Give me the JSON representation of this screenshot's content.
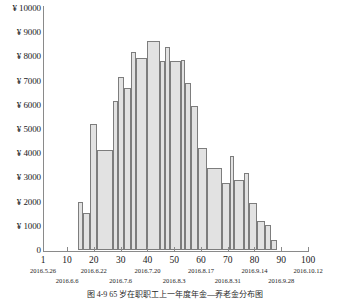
{
  "chart_data": {
    "type": "bar",
    "title": "",
    "subtitle": "",
    "xlabel": "",
    "ylabel": "",
    "xlim": [
      1,
      100
    ],
    "ylim": [
      0,
      10000
    ],
    "grid": false,
    "legend": null,
    "y_ticks": [
      {
        "value": 10000,
        "label": "¥ 10000"
      },
      {
        "value": 9000,
        "label": "¥ 9000"
      },
      {
        "value": 8000,
        "label": "¥ 8000"
      },
      {
        "value": 7000,
        "label": "¥ 7000"
      },
      {
        "value": 6000,
        "label": "¥ 6000"
      },
      {
        "value": 5000,
        "label": "¥ 5000"
      },
      {
        "value": 4000,
        "label": "¥ 4000"
      },
      {
        "value": 3000,
        "label": "¥ 3000"
      },
      {
        "value": 2000,
        "label": "¥ 2000"
      },
      {
        "value": 1000,
        "label": "¥ 1000"
      },
      {
        "value": 0,
        "label": "0"
      }
    ],
    "x_ticks": [
      {
        "value": 1,
        "label": "1",
        "date_upper": "2016.5.26",
        "date_lower": ""
      },
      {
        "value": 10,
        "label": "10",
        "date_upper": "",
        "date_lower": "2016.6.6"
      },
      {
        "value": 20,
        "label": "20",
        "date_upper": "2016.6.22",
        "date_lower": ""
      },
      {
        "value": 30,
        "label": "30",
        "date_upper": "",
        "date_lower": "2016.7.6"
      },
      {
        "value": 40,
        "label": "40",
        "date_upper": "2016.7.20",
        "date_lower": ""
      },
      {
        "value": 50,
        "label": "50",
        "date_upper": "",
        "date_lower": "2016.8.3"
      },
      {
        "value": 60,
        "label": "60",
        "date_upper": "2016.8.17",
        "date_lower": ""
      },
      {
        "value": 70,
        "label": "70",
        "date_upper": "",
        "date_lower": "2016.8.31"
      },
      {
        "value": 80,
        "label": "80",
        "date_upper": "2016.9.14",
        "date_lower": ""
      },
      {
        "value": 90,
        "label": "90",
        "date_upper": "",
        "date_lower": "2016.9.28"
      },
      {
        "value": 100,
        "label": "100",
        "date_upper": "2016.10.12",
        "date_lower": ""
      }
    ],
    "bar_color": "#e2e2e2",
    "bar_edge_color": "#7d7d7d",
    "categories": [
      "14",
      "16",
      "18",
      "21",
      "24",
      "26",
      "29",
      "31",
      "34",
      "36",
      "39",
      "42",
      "45",
      "48",
      "51",
      "54",
      "57",
      "60",
      "63",
      "66",
      "69",
      "72",
      "75",
      "78",
      "81",
      "84",
      "87",
      "90",
      "93",
      "96"
    ],
    "bars": [
      {
        "x_start": 14.0,
        "x_end": 16.0,
        "value": 2000
      },
      {
        "x_start": 16.0,
        "x_end": 18.6,
        "value": 1550
      },
      {
        "x_start": 18.6,
        "x_end": 21.3,
        "value": 5200
      },
      {
        "x_start": 21.3,
        "x_end": 27.0,
        "value": 4150
      },
      {
        "x_start": 27.0,
        "x_end": 29.2,
        "value": 6150
      },
      {
        "x_start": 29.2,
        "x_end": 31.3,
        "value": 7150
      },
      {
        "x_start": 31.3,
        "x_end": 34.0,
        "value": 6700
      },
      {
        "x_start": 34.0,
        "x_end": 35.6,
        "value": 8200
      },
      {
        "x_start": 35.6,
        "x_end": 39.8,
        "value": 7950
      },
      {
        "x_start": 39.8,
        "x_end": 44.7,
        "value": 8650
      },
      {
        "x_start": 44.7,
        "x_end": 46.5,
        "value": 7800
      },
      {
        "x_start": 46.5,
        "x_end": 48.3,
        "value": 8400
      },
      {
        "x_start": 48.3,
        "x_end": 52.5,
        "value": 7800
      },
      {
        "x_start": 52.5,
        "x_end": 54.2,
        "value": 7850
      },
      {
        "x_start": 54.2,
        "x_end": 56.2,
        "value": 6900
      },
      {
        "x_start": 56.2,
        "x_end": 58.8,
        "value": 5950
      },
      {
        "x_start": 58.8,
        "x_end": 62.4,
        "value": 4200
      },
      {
        "x_start": 62.4,
        "x_end": 67.8,
        "value": 3400
      },
      {
        "x_start": 67.8,
        "x_end": 70.9,
        "value": 2750
      },
      {
        "x_start": 70.9,
        "x_end": 72.5,
        "value": 3900
      },
      {
        "x_start": 72.5,
        "x_end": 76.0,
        "value": 2900
      },
      {
        "x_start": 76.0,
        "x_end": 78.0,
        "value": 3200
      },
      {
        "x_start": 78.0,
        "x_end": 81.0,
        "value": 1950
      },
      {
        "x_start": 81.0,
        "x_end": 83.8,
        "value": 1200
      },
      {
        "x_start": 83.8,
        "x_end": 86.0,
        "value": 1050
      },
      {
        "x_start": 86.0,
        "x_end": 88.5,
        "value": 400
      }
    ]
  },
  "caption": {
    "text": "图 4-9    65 岁在职职工上一年度年金—养老金分布图"
  }
}
